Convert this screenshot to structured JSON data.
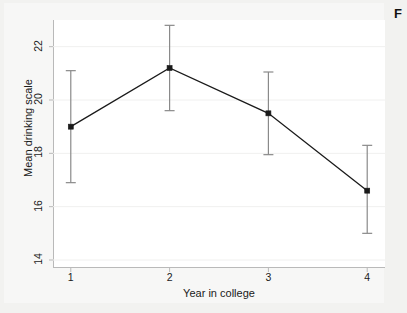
{
  "figure": {
    "corner_caption_fragment": "F",
    "background_color": "#f2f2f0",
    "plot_background_color": "#ffffff",
    "axis_color": "#b9b9b9",
    "series_color": "#1a1a1a",
    "gridline_color": "#f0f0ef"
  },
  "chart_data": {
    "type": "line",
    "title": "",
    "subtitle": "",
    "xlabel": "Year in college",
    "ylabel": "Mean drinking scale",
    "x": [
      1,
      2,
      3,
      4
    ],
    "xtick_labels": [
      "1",
      "2",
      "3",
      "4"
    ],
    "ytick_labels": [
      "14",
      "16",
      "18",
      "20",
      "22"
    ],
    "yticks": [
      14,
      16,
      18,
      20,
      22
    ],
    "xlim": [
      0.82,
      4.18
    ],
    "ylim": [
      13.7,
      23.0
    ],
    "grid": true,
    "legend": null,
    "legend_position": "none",
    "marker": "square",
    "error_bars": "vertical 95% CI with caps",
    "series": [
      {
        "name": "Mean drinking scale",
        "values": [
          19.0,
          21.2,
          19.5,
          16.6
        ],
        "error_low": [
          16.9,
          19.6,
          17.95,
          15.0
        ],
        "error_high": [
          21.1,
          22.8,
          21.05,
          18.3
        ]
      }
    ]
  }
}
